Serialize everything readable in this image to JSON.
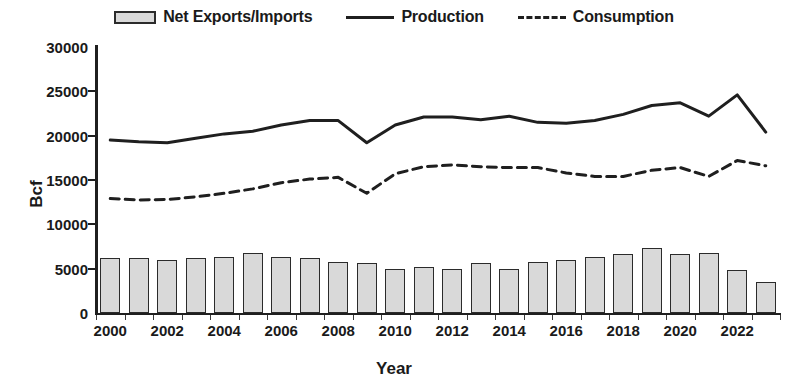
{
  "chart_data": {
    "type": "bar",
    "title": "",
    "xlabel": "Year",
    "ylabel": "Bcf",
    "ylim": [
      0,
      30000
    ],
    "ytick_values": [
      0,
      5000,
      10000,
      15000,
      20000,
      25000,
      30000
    ],
    "ytick_labels": [
      "0",
      "5000",
      "10000",
      "15000",
      "20000",
      "25000",
      "30000"
    ],
    "grid": false,
    "legend_position": "top-center",
    "categories": [
      "2000",
      "2001",
      "2002",
      "2003",
      "2004",
      "2005",
      "2006",
      "2007",
      "2008",
      "2009",
      "2010",
      "2011",
      "2012",
      "2013",
      "2014",
      "2015",
      "2016",
      "2017",
      "2018",
      "2019",
      "2020",
      "2021",
      "2022",
      "2023"
    ],
    "xtick_labels": [
      "2000",
      "2002",
      "2004",
      "2006",
      "2008",
      "2010",
      "2012",
      "2014",
      "2016",
      "2018",
      "2020",
      "2022"
    ],
    "series": [
      {
        "name": "Net Exports/Imports",
        "type": "bar",
        "color": "#d9d9d9",
        "edge_color": "#2b2b2b",
        "values": [
          6200,
          6150,
          6000,
          6150,
          6350,
          6800,
          6300,
          6200,
          5800,
          5650,
          5000,
          5150,
          5000,
          5600,
          5000,
          5700,
          6000,
          6350,
          6700,
          7350,
          6600,
          6800,
          4800,
          3550
        ]
      },
      {
        "name": "Production",
        "type": "line",
        "color": "#1f1f1f",
        "style": "solid",
        "values": [
          19500,
          19300,
          19200,
          19700,
          20200,
          20500,
          21200,
          21700,
          21700,
          19200,
          21200,
          22100,
          22100,
          21800,
          22200,
          21500,
          21400,
          21700,
          22400,
          23400,
          23700,
          22200,
          24600,
          20400
        ]
      },
      {
        "name": "Consumption",
        "type": "line",
        "color": "#1f1f1f",
        "style": "dashed",
        "values": [
          12900,
          12750,
          12800,
          13100,
          13500,
          14000,
          14700,
          15100,
          15300,
          13500,
          15700,
          16500,
          16700,
          16500,
          16400,
          16400,
          15800,
          15400,
          15400,
          16100,
          16400,
          15400,
          17200,
          16600
        ]
      }
    ]
  },
  "legend": [
    {
      "label": "Net Exports/Imports",
      "marker": "bar-swatch"
    },
    {
      "label": "Production",
      "marker": "solid-line-swatch"
    },
    {
      "label": "Consumption",
      "marker": "dashed-line-swatch"
    }
  ],
  "axes": {
    "y_title": "Bcf",
    "x_title": "Year"
  }
}
